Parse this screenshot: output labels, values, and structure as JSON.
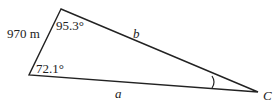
{
  "diagram": {
    "type": "triangle",
    "vertices": {
      "top": {
        "x": 61,
        "y": 9
      },
      "left": {
        "x": 29,
        "y": 75
      },
      "C": {
        "x": 258,
        "y": 92
      }
    },
    "labels": {
      "side_left": "970 m",
      "angle_top": "95.3°",
      "angle_left": "72.1°",
      "side_b": "b",
      "side_a": "a",
      "vertex_C": "C"
    },
    "stroke_color": "#222222"
  }
}
